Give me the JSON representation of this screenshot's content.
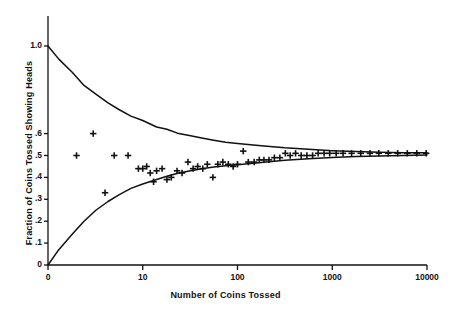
{
  "chart_data": {
    "type": "scatter",
    "title": "",
    "xlabel": "Number of Coins Tossed",
    "ylabel": "Fraction of Coins Tossed  Showing Heads",
    "xscale": "log",
    "xlim": [
      1,
      10000
    ],
    "ylim": [
      0,
      1.0
    ],
    "grid": false,
    "legend": null,
    "xticks": [
      {
        "label": "0",
        "value": 1
      },
      {
        "label": "10",
        "value": 10
      },
      {
        "label": "100",
        "value": 100
      },
      {
        "label": "1000",
        "value": 1000
      },
      {
        "label": "10000",
        "value": 10000
      }
    ],
    "yticks": [
      {
        "label": "1.0",
        "value": 1.0
      },
      {
        "label": ".6",
        "value": 0.6
      },
      {
        "label": ".5",
        "value": 0.5
      },
      {
        "label": ".4",
        "value": 0.4
      },
      {
        "label": ".3",
        "value": 0.3
      },
      {
        "label": ".2",
        "value": 0.2
      },
      {
        "label": ".1",
        "value": 0.1
      },
      {
        "label": "0",
        "value": 0.0
      }
    ],
    "series": [
      {
        "name": "observed fraction heads",
        "type": "scatter",
        "marker": "plus",
        "color": "#111111",
        "points": [
          [
            2,
            0.5
          ],
          [
            3,
            0.6
          ],
          [
            4,
            0.33
          ],
          [
            5,
            0.5
          ],
          [
            7,
            0.5
          ],
          [
            9,
            0.44
          ],
          [
            10,
            0.44
          ],
          [
            11,
            0.45
          ],
          [
            12,
            0.42
          ],
          [
            13,
            0.38
          ],
          [
            14,
            0.43
          ],
          [
            16,
            0.44
          ],
          [
            18,
            0.39
          ],
          [
            20,
            0.4
          ],
          [
            23,
            0.43
          ],
          [
            26,
            0.42
          ],
          [
            30,
            0.47
          ],
          [
            34,
            0.44
          ],
          [
            38,
            0.45
          ],
          [
            43,
            0.44
          ],
          [
            48,
            0.46
          ],
          [
            55,
            0.4
          ],
          [
            62,
            0.46
          ],
          [
            70,
            0.47
          ],
          [
            80,
            0.46
          ],
          [
            90,
            0.45
          ],
          [
            100,
            0.46
          ],
          [
            115,
            0.52
          ],
          [
            130,
            0.47
          ],
          [
            150,
            0.47
          ],
          [
            170,
            0.48
          ],
          [
            190,
            0.48
          ],
          [
            215,
            0.48
          ],
          [
            245,
            0.49
          ],
          [
            280,
            0.49
          ],
          [
            320,
            0.51
          ],
          [
            360,
            0.5
          ],
          [
            410,
            0.51
          ],
          [
            470,
            0.5
          ],
          [
            540,
            0.5
          ],
          [
            620,
            0.5
          ],
          [
            710,
            0.51
          ],
          [
            820,
            0.51
          ],
          [
            940,
            0.51
          ],
          [
            1100,
            0.51
          ],
          [
            1300,
            0.51
          ],
          [
            1600,
            0.51
          ],
          [
            2000,
            0.51
          ],
          [
            2500,
            0.51
          ],
          [
            3100,
            0.51
          ],
          [
            3900,
            0.51
          ],
          [
            4900,
            0.51
          ],
          [
            6200,
            0.51
          ],
          [
            7800,
            0.51
          ],
          [
            9800,
            0.51
          ]
        ]
      },
      {
        "name": "upper envelope",
        "type": "line",
        "color": "#111111",
        "points": [
          [
            1,
            1.0
          ],
          [
            1.3,
            0.94
          ],
          [
            1.8,
            0.88
          ],
          [
            2.4,
            0.82
          ],
          [
            3.2,
            0.78
          ],
          [
            4.3,
            0.74
          ],
          [
            5.6,
            0.71
          ],
          [
            7.5,
            0.68
          ],
          [
            10,
            0.66
          ],
          [
            14,
            0.63
          ],
          [
            18,
            0.62
          ],
          [
            24,
            0.6
          ],
          [
            32,
            0.59
          ],
          [
            42,
            0.58
          ],
          [
            56,
            0.57
          ],
          [
            75,
            0.56
          ],
          [
            100,
            0.555
          ],
          [
            178,
            0.545
          ],
          [
            316,
            0.535
          ],
          [
            562,
            0.528
          ],
          [
            1000,
            0.522
          ],
          [
            1780,
            0.518
          ],
          [
            3160,
            0.515
          ],
          [
            5620,
            0.513
          ],
          [
            10000,
            0.512
          ]
        ]
      },
      {
        "name": "lower envelope",
        "type": "line",
        "color": "#111111",
        "points": [
          [
            1,
            0.0
          ],
          [
            1.3,
            0.07
          ],
          [
            1.8,
            0.14
          ],
          [
            2.4,
            0.2
          ],
          [
            3.2,
            0.25
          ],
          [
            4.3,
            0.29
          ],
          [
            5.6,
            0.32
          ],
          [
            7.5,
            0.35
          ],
          [
            10,
            0.37
          ],
          [
            14,
            0.39
          ],
          [
            18,
            0.405
          ],
          [
            24,
            0.42
          ],
          [
            32,
            0.43
          ],
          [
            42,
            0.44
          ],
          [
            56,
            0.447
          ],
          [
            75,
            0.453
          ],
          [
            100,
            0.458
          ],
          [
            178,
            0.468
          ],
          [
            316,
            0.478
          ],
          [
            562,
            0.485
          ],
          [
            1000,
            0.491
          ],
          [
            1780,
            0.495
          ],
          [
            3160,
            0.498
          ],
          [
            5620,
            0.5
          ],
          [
            10000,
            0.502
          ]
        ]
      }
    ]
  },
  "axes": {
    "x_title": "Number of Coins Tossed",
    "y_title": "Fraction of Coins  Tossed  Showing Heads"
  }
}
